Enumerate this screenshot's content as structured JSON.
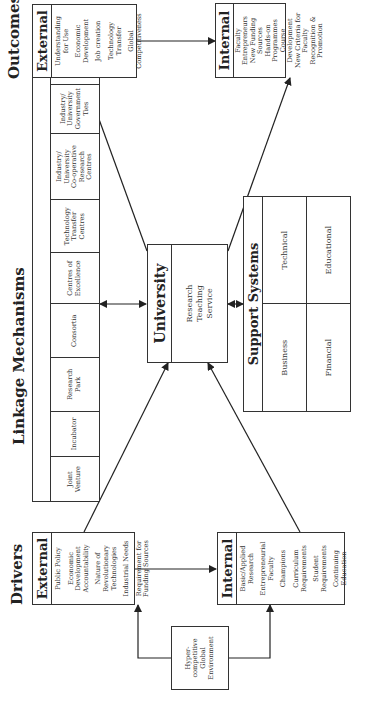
{
  "drivers": {
    "title": "Drivers",
    "external": {
      "header": "External",
      "items": [
        "Public Policy",
        "Economic\nDevelopment\nAccountability",
        "Nature of\nRevolutionary\nTechnologies",
        "Industrial Needs",
        "Requirement for\nFunding Sources"
      ]
    },
    "internal": {
      "header": "Internal",
      "items": [
        "Basic/Applied\nResearch",
        "Entrepreneurial\nFaculty",
        "Champions",
        "Curriculum\nRequirements",
        "Student\nRequirements",
        "Continuing\nEducation"
      ]
    },
    "environment": "Hyper-\ncompetitive\nGlobal\nEnvironment"
  },
  "linkage": {
    "title": "Linkage Mechanisms",
    "cells": [
      "Joint\nVenture",
      "Incubator",
      "Research\nPark",
      "Consortia",
      "Centres of\nExcellence",
      "Technology\nTransfer\nCentres",
      "Industry/\nUniversity\nCo-operative\nResearch\nCentres",
      "Industry/\nUniversity\nGovernment\nTies",
      "New\nTypes of\nCurriculum"
    ]
  },
  "university": {
    "header": "University",
    "body": "Research\nTeaching\nService"
  },
  "support": {
    "header": "Support Systems",
    "cells": [
      "Business",
      "Technical",
      "Financial",
      "Educational"
    ]
  },
  "outcomes": {
    "title": "Outcomes",
    "external": {
      "header": "External",
      "items": [
        "Understanding\nfor Use",
        "Economic\nDevelopment",
        "Job creation",
        "Technology\nTransfer",
        "Global\nCompetitiveness"
      ]
    },
    "internal": {
      "header": "Internal",
      "items": [
        "Faculty\nEntrepreneurs",
        "New Funding\nSources",
        "Hands-on\nProgrammes",
        "Course\nDevelopment",
        "New Criteria for\nFaculty",
        "Recognition &\nPromotion"
      ]
    }
  }
}
